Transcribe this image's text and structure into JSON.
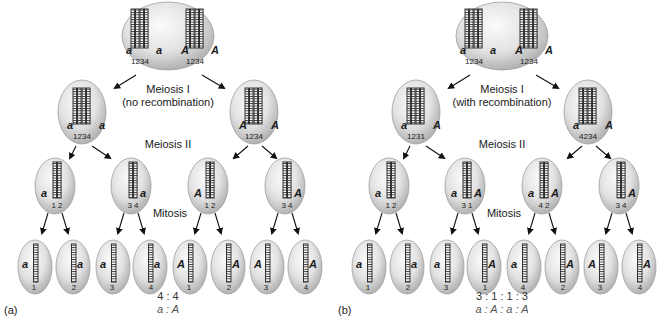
{
  "figure": {
    "panels": [
      {
        "id": "a",
        "panel_label": "(a)",
        "meiosis1_label": "Meiosis I",
        "meiosis1_sub": "(no recombination)",
        "meiosis2_label": "Meiosis II",
        "mitosis_label": "Mitosis",
        "ratio_numbers": "4 : 4",
        "ratio_alleles": "a : A",
        "parent_cell": {
          "pairs": [
            {
              "left": "a",
              "right": "a",
              "numbers": "1234"
            },
            {
              "left": "A",
              "right": "A",
              "numbers": "1234"
            }
          ]
        },
        "meiosis1_cells": [
          {
            "left": "a",
            "right": "a",
            "numbers": "1234"
          },
          {
            "left": "A",
            "right": "A",
            "numbers": "1234"
          }
        ],
        "meiosis2_cells": [
          {
            "left": "a",
            "right": "",
            "numbers": "1 2"
          },
          {
            "left": "",
            "right": "a",
            "numbers": "3 4"
          },
          {
            "left": "A",
            "right": "",
            "numbers": "1 2"
          },
          {
            "left": "",
            "right": "A",
            "numbers": "3 4"
          }
        ],
        "spores": [
          {
            "left": "a",
            "right": "",
            "number": "1"
          },
          {
            "left": "",
            "right": "a",
            "number": "2"
          },
          {
            "left": "a",
            "right": "",
            "number": "3"
          },
          {
            "left": "",
            "right": "a",
            "number": "4"
          },
          {
            "left": "A",
            "right": "",
            "number": "1"
          },
          {
            "left": "",
            "right": "A",
            "number": "2"
          },
          {
            "left": "A",
            "right": "",
            "number": "3"
          },
          {
            "left": "",
            "right": "A",
            "number": "4"
          }
        ]
      },
      {
        "id": "b",
        "panel_label": "(b)",
        "meiosis1_label": "Meiosis I",
        "meiosis1_sub": "(with recombination)",
        "meiosis2_label": "Meiosis II",
        "mitosis_label": "Mitosis",
        "ratio_numbers": "3 : 1 : 1 : 3",
        "ratio_alleles": "a : A : a : A",
        "parent_cell": {
          "pairs": [
            {
              "left": "a",
              "right": "a",
              "numbers": "1234"
            },
            {
              "left": "A",
              "right": "A",
              "numbers": "1234"
            }
          ]
        },
        "meiosis1_cells": [
          {
            "left": "a",
            "right": "A",
            "numbers": "1231"
          },
          {
            "left": "a",
            "right": "A",
            "numbers": "4234"
          }
        ],
        "meiosis2_cells": [
          {
            "left": "a",
            "right": "",
            "numbers": "1 2"
          },
          {
            "left": "a",
            "right": "A",
            "numbers": "3 1"
          },
          {
            "left": "a",
            "right": "A",
            "numbers": "4 2"
          },
          {
            "left": "",
            "right": "A",
            "numbers": "3 4"
          }
        ],
        "spores": [
          {
            "left": "a",
            "right": "",
            "number": "1"
          },
          {
            "left": "",
            "right": "a",
            "number": "2"
          },
          {
            "left": "a",
            "right": "",
            "number": "3"
          },
          {
            "left": "",
            "right": "A",
            "number": "1"
          },
          {
            "left": "a",
            "right": "",
            "number": "4"
          },
          {
            "left": "",
            "right": "A",
            "number": "2"
          },
          {
            "left": "A",
            "right": "",
            "number": "3"
          },
          {
            "left": "",
            "right": "A",
            "number": "4"
          }
        ]
      }
    ],
    "colors": {
      "cell_fill_light": "#f4f4f4",
      "cell_fill_dark": "#b9b9b9",
      "cell_stroke": "#9a9a9a",
      "chromatid": "#2a2a2a",
      "arrow": "#111111"
    }
  }
}
